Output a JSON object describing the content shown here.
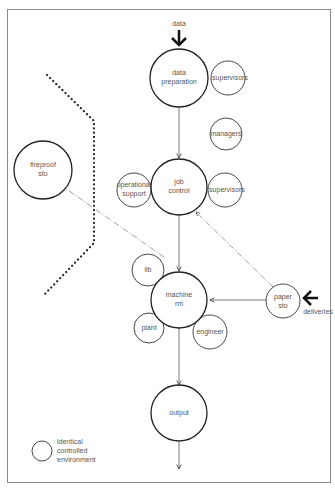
{
  "diagram": {
    "inputs": {
      "data_label": "data",
      "deliveries_label": "deliveries"
    },
    "main_nodes": [
      {
        "id": "data-preparation",
        "lines": [
          "data",
          "preparation"
        ]
      },
      {
        "id": "job-control",
        "lines": [
          "job",
          "control"
        ]
      },
      {
        "id": "machine-rm",
        "lines": [
          "machine",
          "rm"
        ]
      },
      {
        "id": "output",
        "lines": [
          "output"
        ]
      }
    ],
    "satellite_nodes": [
      {
        "id": "supervisors-1",
        "lines": [
          "supervisors"
        ]
      },
      {
        "id": "managers",
        "lines": [
          "managers"
        ]
      },
      {
        "id": "operational-support",
        "lines": [
          "operational",
          "support"
        ]
      },
      {
        "id": "supervisors-2",
        "lines": [
          "supervisors"
        ]
      },
      {
        "id": "lib",
        "lines": [
          "lib"
        ]
      },
      {
        "id": "plant",
        "lines": [
          "plant"
        ]
      },
      {
        "id": "engineer",
        "lines": [
          "engineer"
        ]
      },
      {
        "id": "paper-sto",
        "lines": [
          "paper",
          "sto"
        ]
      },
      {
        "id": "fireproof-sto",
        "lines": [
          "fireproof",
          "sto"
        ]
      }
    ],
    "legend": {
      "lines": [
        "identical",
        "controlled",
        "environment"
      ]
    }
  }
}
